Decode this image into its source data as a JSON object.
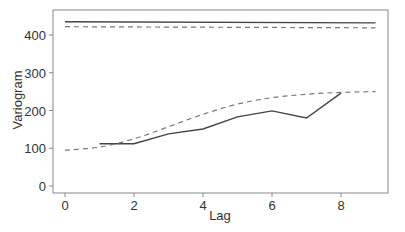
{
  "chart_data": {
    "type": "line",
    "title": "",
    "xlabel": "Lag",
    "ylabel": "Variogram",
    "xlim": [
      -0.35,
      9.3
    ],
    "ylim": [
      -15,
      460
    ],
    "xticks": [
      0,
      2,
      4,
      6,
      8
    ],
    "yticks": [
      0,
      100,
      200,
      300,
      400
    ],
    "grid": false,
    "legend": null,
    "series": [
      {
        "name": "empirical variogram",
        "style": "solid",
        "x": [
          1,
          2,
          3,
          4,
          5,
          6,
          7,
          8
        ],
        "y": [
          112,
          112,
          138,
          151,
          183,
          199,
          180,
          246
        ]
      },
      {
        "name": "fitted model",
        "style": "dashed",
        "x": [
          0,
          1,
          2,
          3,
          4,
          5,
          6,
          7,
          8,
          9
        ],
        "y": [
          95,
          103,
          125,
          157,
          190,
          217,
          234,
          243,
          248,
          250
        ]
      },
      {
        "name": "total variance",
        "style": "solid",
        "x": [
          0,
          9
        ],
        "y": [
          435,
          432
        ]
      },
      {
        "name": "model variance",
        "style": "dashed",
        "x": [
          0,
          9
        ],
        "y": [
          422,
          419
        ]
      }
    ]
  }
}
